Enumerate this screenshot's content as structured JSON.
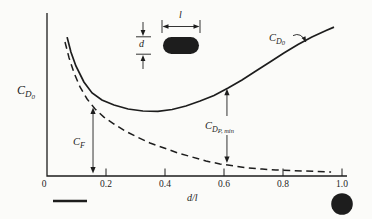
{
  "figure": {
    "paper_color": "#fbfbf9",
    "ink_color": "#1d1d1d"
  },
  "labels": {
    "y_axis": {
      "base": "C",
      "sub": "D",
      "subsub": "0"
    },
    "curve_total": {
      "base": "C",
      "sub": "D",
      "subsub": "0"
    },
    "friction": {
      "base": "C",
      "sub": "F"
    },
    "pressure_min": {
      "base": "C",
      "sub": "D",
      "subsub": "P, min"
    },
    "x_axis": "d/l",
    "inset_length": "l",
    "inset_diameter": "d"
  },
  "symbols": {
    "left_limit": "flat-plate-line",
    "right_limit": "filled-circle-bluff-body",
    "inset_body": "black-pill-shaped-body"
  },
  "chart_data": {
    "type": "line",
    "title": "",
    "xlabel": "d/l",
    "ylabel": "C_D0",
    "xlim": [
      0,
      1.0
    ],
    "ylim": [
      0,
      1
    ],
    "y_units": "qualitative (no y tick values shown)",
    "grid": false,
    "x_ticks": [
      0,
      0.2,
      0.4,
      0.6,
      0.8,
      1.0
    ],
    "x_tick_labels": [
      "0",
      "0.2",
      "0.4",
      "0.6",
      "0.8",
      "1.0"
    ],
    "series": [
      {
        "name": "C_D0 (total drag)",
        "style": "solid",
        "x": [
          0.068,
          0.081,
          0.098,
          0.125,
          0.153,
          0.186,
          0.227,
          0.275,
          0.325,
          0.376,
          0.424,
          0.471,
          0.519,
          0.566,
          0.614,
          0.661,
          0.708,
          0.756,
          0.803,
          0.851,
          0.898,
          0.946,
          0.973
        ],
        "y": [
          0.863,
          0.77,
          0.683,
          0.584,
          0.516,
          0.472,
          0.441,
          0.416,
          0.404,
          0.401,
          0.413,
          0.435,
          0.466,
          0.5,
          0.547,
          0.596,
          0.652,
          0.708,
          0.764,
          0.817,
          0.863,
          0.904,
          0.925
        ]
      },
      {
        "name": "C_F (friction drag)",
        "style": "dashed",
        "x": [
          0.061,
          0.075,
          0.092,
          0.112,
          0.136,
          0.163,
          0.193,
          0.227,
          0.264,
          0.305,
          0.349,
          0.397,
          0.444,
          0.492,
          0.539,
          0.586,
          0.634,
          0.681,
          0.729,
          0.776,
          0.824,
          0.871,
          0.919,
          0.963
        ],
        "y": [
          0.832,
          0.733,
          0.64,
          0.553,
          0.478,
          0.416,
          0.366,
          0.323,
          0.28,
          0.242,
          0.205,
          0.174,
          0.143,
          0.118,
          0.093,
          0.075,
          0.062,
          0.05,
          0.043,
          0.037,
          0.034,
          0.031,
          0.028,
          0.025
        ]
      }
    ],
    "annotations": [
      {
        "id": "cf",
        "type": "double_arrow",
        "x": 0.156,
        "y_from": 0.015,
        "y_to": 0.425,
        "label": "C_F"
      },
      {
        "id": "cdp",
        "type": "double_arrow",
        "x": 0.61,
        "y_from": 0.08,
        "y_to": 0.542,
        "label": "C_DP,min"
      },
      {
        "id": "cd0",
        "type": "leader_arrow",
        "from": [
          0.834,
          0.872
        ],
        "to": [
          0.878,
          0.832
        ],
        "label": "C_D0"
      }
    ]
  }
}
